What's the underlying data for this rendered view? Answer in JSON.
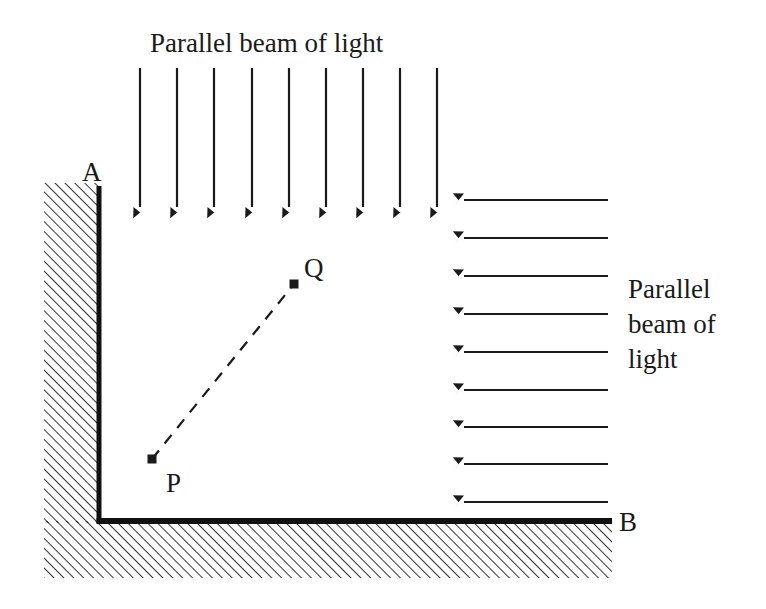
{
  "figure": {
    "kind": "optics-ray-diagram",
    "background_color": "#ffffff",
    "ink_color": "#1a1a1a",
    "width": 766,
    "height": 609
  },
  "labels": {
    "top_beam_caption": "Parallel beam of light",
    "side_beam_caption_line1": "Parallel",
    "side_beam_caption_line2": "beam of",
    "side_beam_caption_line3": "light",
    "mirror_top_vertex": "A",
    "mirror_bottom_vertex": "B",
    "point_p": "P",
    "point_q": "Q"
  },
  "mirror": {
    "vertical_arm": {
      "x": 99,
      "y_top": 186,
      "y_bottom": 523,
      "thickness": 5,
      "color": "#111111"
    },
    "horizontal_arm": {
      "y": 521,
      "x_left": 99,
      "x_right": 612,
      "thickness": 6,
      "color": "#111111"
    },
    "hatch": {
      "angle_deg": 45,
      "spacing": 7,
      "line_width": 1.7,
      "color": "#111111",
      "vertical_block": {
        "x": 44,
        "y": 183,
        "width": 55,
        "height": 340
      },
      "horizontal_block": {
        "x": 44,
        "y": 521,
        "width": 568,
        "height": 57
      }
    }
  },
  "top_beam": {
    "count": 9,
    "y_start": 68,
    "y_end": 207,
    "x_positions": [
      140,
      177,
      214,
      252,
      289,
      326,
      363,
      400,
      437
    ],
    "direction": "down",
    "line_width": 2.2
  },
  "side_beam": {
    "count": 9,
    "x_tail": 608,
    "x_tip": 464,
    "y_positions": [
      200,
      238,
      276,
      314,
      352,
      390,
      427,
      464,
      502
    ],
    "direction": "left",
    "line_width": 2.2
  },
  "points": {
    "p": {
      "x": 152,
      "y": 459,
      "marker_size": 9,
      "label_x": 166,
      "label_y": 492
    },
    "q": {
      "x": 294,
      "y": 284,
      "marker_size": 9,
      "label_x": 304,
      "label_y": 277
    },
    "connector": {
      "style": "dashed",
      "dash": "11 9",
      "line_width": 2.2
    }
  },
  "text_positions": {
    "top_caption": {
      "x": 150,
      "y": 52
    },
    "side_caption": {
      "x": 628,
      "y": 298,
      "line_height": 35
    },
    "label_a": {
      "x": 82,
      "y": 181
    },
    "label_b": {
      "x": 619,
      "y": 531
    }
  }
}
